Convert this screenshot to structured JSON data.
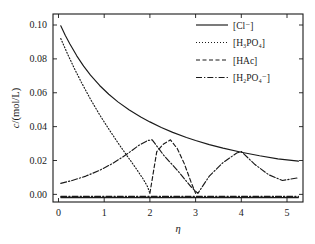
{
  "chart_data": {
    "type": "line",
    "title": "",
    "xlabel": "η",
    "ylabel": "c/(mol/L)",
    "xlim": [
      -0.12,
      5.35
    ],
    "ylim": [
      -0.0045,
      0.1065
    ],
    "grid": false,
    "legend_position": "top-right",
    "x_ticks": [
      0,
      1,
      2,
      3,
      4,
      5
    ],
    "x_ticklabels": [
      "0",
      "1",
      "2",
      "3",
      "4",
      "5"
    ],
    "y_ticks": [
      0.0,
      0.02,
      0.04,
      0.06,
      0.08,
      0.1
    ],
    "y_ticklabels": [
      "0.00",
      "0.02",
      "0.04",
      "0.06",
      "0.08",
      "0.10"
    ],
    "series": [
      {
        "name": "[Cl⁻]",
        "label_html": "[Cl<sup>−</sup>]",
        "style": "solid",
        "dash": "none",
        "color": "#1a1a1a",
        "x": [
          0.05,
          0.15,
          0.25,
          0.4,
          0.55,
          0.7,
          0.9,
          1.1,
          1.3,
          1.55,
          1.8,
          2.0,
          2.25,
          2.5,
          2.8,
          3.0,
          3.3,
          3.6,
          4.0,
          4.4,
          4.8,
          5.25
        ],
        "y": [
          0.0995,
          0.0938,
          0.0888,
          0.0818,
          0.0757,
          0.0704,
          0.0643,
          0.0591,
          0.0546,
          0.0498,
          0.0457,
          0.0428,
          0.0395,
          0.0366,
          0.0336,
          0.0318,
          0.0294,
          0.0273,
          0.0249,
          0.0228,
          0.021,
          0.0196
        ]
      },
      {
        "name": "[H3PO4]",
        "label_html": "[H<sub>3</sub>PO<sub>4</sub>]",
        "style": "dotted",
        "dash": "1,2",
        "color": "#1a1a1a",
        "x": [
          0.05,
          0.2,
          0.35,
          0.5,
          0.7,
          0.9,
          1.1,
          1.3,
          1.5,
          1.7,
          1.85,
          1.95,
          2.0
        ],
        "y": [
          0.092,
          0.0828,
          0.0742,
          0.0662,
          0.0562,
          0.047,
          0.0386,
          0.0305,
          0.0228,
          0.0152,
          0.0092,
          0.0045,
          0.0006
        ]
      },
      {
        "name": "[HAc]",
        "label_html": "[HAc]",
        "style": "dashed",
        "dash": "4,2.5",
        "color": "#1a1a1a",
        "x": [
          2.0,
          2.15,
          2.3,
          2.45,
          2.6,
          2.75,
          2.9,
          3.0
        ],
        "y": [
          0.0006,
          0.0252,
          0.0298,
          0.0322,
          0.027,
          0.0183,
          0.0073,
          0.0006
        ],
        "note": "peak near eta 2.45 at 0.0322; descends to baseline at eta 3"
      },
      {
        "name": "[H2PO4-]",
        "label_html": "[H<sub>2</sub>PO<sub>4</sub><sup>−</sup>]",
        "style": "dashdot",
        "dash": "6,2,1.3,2",
        "color": "#1a1a1a",
        "x": [
          0.05,
          0.3,
          0.6,
          0.9,
          1.2,
          1.5,
          1.75,
          1.95,
          2.05,
          2.3,
          2.6,
          2.9,
          3.05,
          3.3,
          3.6,
          3.9,
          4.0,
          4.3,
          4.6,
          4.9,
          5.25
        ],
        "y": [
          0.0065,
          0.0082,
          0.0108,
          0.0142,
          0.0185,
          0.0238,
          0.0288,
          0.0318,
          0.0322,
          0.0232,
          0.0142,
          0.0045,
          0.0006,
          0.0108,
          0.0188,
          0.0244,
          0.0253,
          0.0176,
          0.0116,
          0.0082,
          0.0098
        ],
        "note": "zigzag: rises to peak eta 2, falls to 3, rises to peak eta 4, falls toward 5.25"
      },
      {
        "name": "baseline",
        "label_html": "",
        "style": "dashdot",
        "dash": "6,2,1.3,2",
        "color": "#1a1a1a",
        "x": [
          0.05,
          5.25
        ],
        "y": [
          -0.0012,
          -0.0012
        ],
        "note": "flat near-zero dash-dot baseline across plot"
      },
      {
        "name": "baseline-solid",
        "label_html": "",
        "style": "solid",
        "dash": "none",
        "color": "#1a1a1a",
        "x": [
          0.05,
          5.25
        ],
        "y": [
          -0.0019,
          -0.0019
        ],
        "note": "flat solid baseline across plot"
      }
    ],
    "legend_entries": [
      {
        "label": "[Cl⁻]",
        "style": "solid"
      },
      {
        "label": "[H₃PO₄]",
        "style": "dotted"
      },
      {
        "label": "[HAc]",
        "style": "dashed"
      },
      {
        "label": "[H₂PO₄⁻]",
        "style": "dashdot"
      }
    ]
  },
  "axes": {
    "y_label": "c/(mol/L)",
    "x_label": "η",
    "y_ticklabels": [
      "0.00",
      "0.02",
      "0.04",
      "0.06",
      "0.08",
      "0.10"
    ],
    "x_ticklabels": [
      "0",
      "1",
      "2",
      "3",
      "4",
      "5"
    ]
  },
  "legend": {
    "entry_1": "[Cl⁻]",
    "entry_2": "[H₃PO₄]",
    "entry_3": "[HAc]",
    "entry_4": "[H₂PO₄⁻]"
  }
}
